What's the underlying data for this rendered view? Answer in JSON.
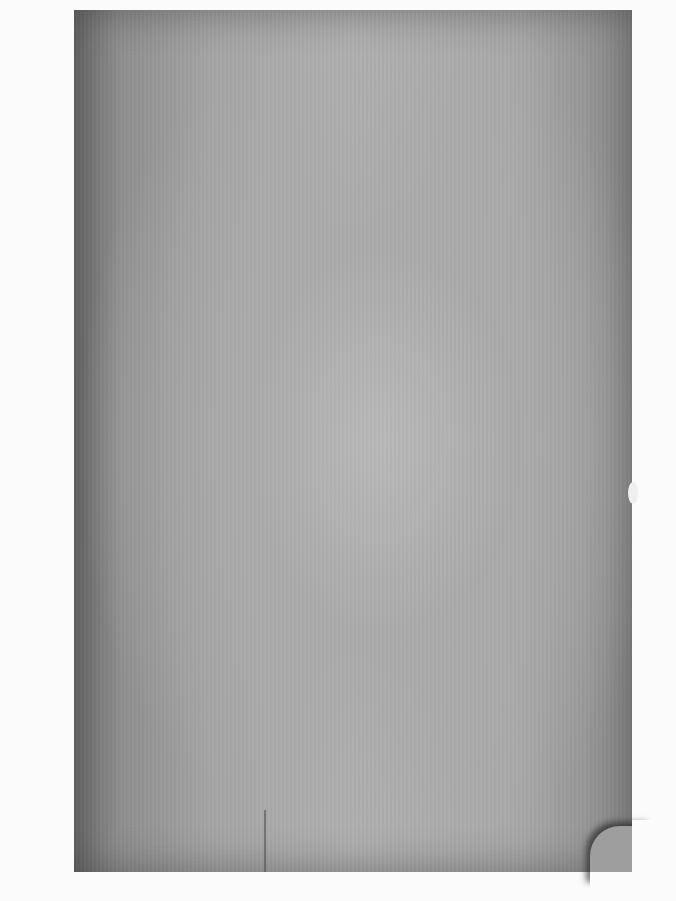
{
  "document": {
    "type": "scanned-page",
    "content": "",
    "colors": {
      "background": "#fbfbfb",
      "page_gray": "#a8a8a8",
      "page_edge_dark": "#6e6e6e"
    }
  }
}
